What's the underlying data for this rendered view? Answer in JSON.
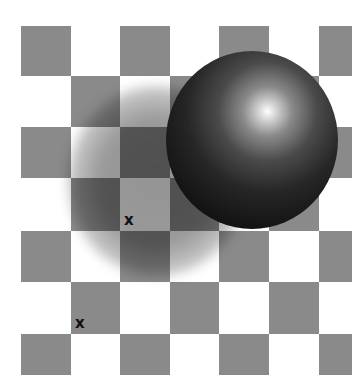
{
  "image": {
    "title": "Checker shadow illusion",
    "width": 352,
    "height": 375
  },
  "colors": {
    "light_square": "#ffffff",
    "dark_square": "#8a8a8a",
    "sphere_dark": "#141414",
    "sphere_highlight": "#ffffff",
    "marker": "#111111"
  },
  "board": {
    "col_edges": [
      21,
      71,
      120,
      170,
      219,
      269,
      319,
      352
    ],
    "row_edges": [
      26,
      76,
      127,
      178,
      231,
      282,
      334,
      375
    ],
    "dark_when_row_plus_col_even": true
  },
  "sphere": {
    "center": [
      252,
      140
    ],
    "radius": 87,
    "highlight": [
      268,
      111
    ]
  },
  "shadow": {
    "center": [
      157,
      181
    ],
    "radius": 90
  },
  "markers": [
    {
      "label": "x",
      "x": 124,
      "y": 213
    },
    {
      "label": "x",
      "x": 75,
      "y": 316
    }
  ]
}
